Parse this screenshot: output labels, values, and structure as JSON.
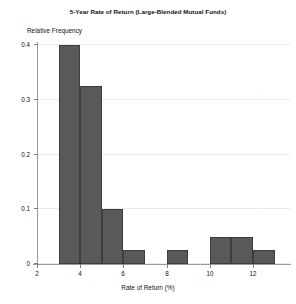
{
  "chart_data": {
    "type": "bar",
    "title": "5-Year Rate of Return (Large-Blended Mutual Funds)",
    "subtitle": "",
    "xlabel": "Rate of Return (%)",
    "ylabel": "Relative Frequency",
    "xlim": [
      2,
      13.7
    ],
    "ylim": [
      0,
      0.4
    ],
    "xticks": [
      2,
      4,
      6,
      8,
      10,
      12
    ],
    "xtick_labels": [
      "2",
      "4",
      "6",
      "8",
      "10",
      "12"
    ],
    "yticks": [
      0,
      0.1,
      0.2,
      0.3,
      0.4
    ],
    "ytick_labels": [
      "0",
      "0.1",
      "0.2",
      "0.3",
      "0.4"
    ],
    "grid": "horizontal",
    "legend": "none",
    "bin_width": 1,
    "bar_color": "#595959",
    "bar_edge_color": "#3d3d3d",
    "bins": [
      {
        "label": "3-4",
        "x0": 3,
        "x1": 4,
        "value": 0.4
      },
      {
        "label": "4-5",
        "x0": 4,
        "x1": 5,
        "value": 0.325
      },
      {
        "label": "5-6",
        "x0": 5,
        "x1": 6,
        "value": 0.1
      },
      {
        "label": "6-7",
        "x0": 6,
        "x1": 7,
        "value": 0.025
      },
      {
        "label": "7-8",
        "x0": 7,
        "x1": 8,
        "value": 0
      },
      {
        "label": "8-9",
        "x0": 8,
        "x1": 9,
        "value": 0.025
      },
      {
        "label": "9-10",
        "x0": 9,
        "x1": 10,
        "value": 0
      },
      {
        "label": "10-11",
        "x0": 10,
        "x1": 11,
        "value": 0.05
      },
      {
        "label": "11-12",
        "x0": 11,
        "x1": 12,
        "value": 0.05
      },
      {
        "label": "12-13",
        "x0": 12,
        "x1": 13,
        "value": 0.025
      }
    ],
    "categories": [
      "3-4",
      "4-5",
      "5-6",
      "6-7",
      "7-8",
      "8-9",
      "9-10",
      "10-11",
      "11-12",
      "12-13"
    ],
    "values": [
      0.4,
      0.325,
      0.1,
      0.025,
      0,
      0.025,
      0,
      0.05,
      0.05,
      0.025
    ]
  }
}
